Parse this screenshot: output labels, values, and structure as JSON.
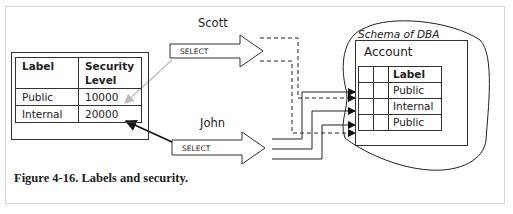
{
  "figure": {
    "caption": "Figure 4-16. Labels and security."
  },
  "users": [
    {
      "name": "Scott",
      "action": "SELECT",
      "access_line_style": "dashed"
    },
    {
      "name": "John",
      "action": "SELECT",
      "access_line_style": "solid"
    }
  ],
  "security_table": {
    "headers": [
      "Label",
      "Security",
      "Level"
    ],
    "rows": [
      {
        "label": "Public",
        "level": "10000"
      },
      {
        "label": "Internal",
        "level": "20000"
      }
    ]
  },
  "schema": {
    "title": "Schema of DBA",
    "table_name": "Account",
    "column_header": "Label",
    "rows": [
      "Public",
      "Internal",
      "Public"
    ]
  },
  "colors": {
    "line": "#222222",
    "scott_link": "#bbbbbb",
    "frame_border": "#d6d6d6"
  }
}
